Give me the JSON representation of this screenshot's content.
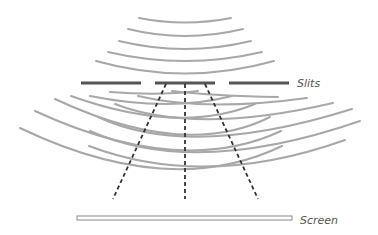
{
  "diagram": {
    "labels": {
      "slits": "Slits",
      "screen": "Screen"
    },
    "colors": {
      "wave": "#a8a8a8",
      "barrier": "#555555",
      "path": "#333333",
      "screen_stroke": "#8a8a8a",
      "label": "#555555"
    },
    "incoming_waves": [
      {
        "x1": 139,
        "y1": 18,
        "cx": 185,
        "cy": 27,
        "x2": 231,
        "y2": 18
      },
      {
        "x1": 128,
        "y1": 29,
        "cx": 185,
        "cy": 43,
        "x2": 243,
        "y2": 29
      },
      {
        "x1": 119,
        "y1": 41,
        "cx": 185,
        "cy": 57,
        "x2": 251,
        "y2": 41
      },
      {
        "x1": 108,
        "y1": 52,
        "cx": 185,
        "cy": 70,
        "x2": 262,
        "y2": 52
      },
      {
        "x1": 96,
        "y1": 61,
        "cx": 185,
        "cy": 86,
        "x2": 274,
        "y2": 61
      }
    ],
    "slit_bars": [
      {
        "x1": 81,
        "x2": 141,
        "y": 83
      },
      {
        "x1": 155,
        "x2": 215,
        "y": 83
      },
      {
        "x1": 229,
        "x2": 289,
        "y": 83
      }
    ],
    "left_source_waves": [
      {
        "x1": 110,
        "y1": 92,
        "cx": 160,
        "cy": 96,
        "x2": 198,
        "y2": 91
      },
      {
        "x1": 90,
        "y1": 96,
        "cx": 170,
        "cy": 112,
        "x2": 232,
        "y2": 96
      },
      {
        "x1": 71,
        "y1": 96,
        "cx": 180,
        "cy": 135,
        "x2": 255,
        "y2": 104
      },
      {
        "x1": 55,
        "y1": 99,
        "cx": 185,
        "cy": 160,
        "x2": 270,
        "y2": 117
      },
      {
        "x1": 35,
        "y1": 111,
        "cx": 180,
        "cy": 178,
        "x2": 281,
        "y2": 131
      },
      {
        "x1": 20,
        "y1": 128,
        "cx": 170,
        "cy": 200,
        "x2": 282,
        "y2": 146
      }
    ],
    "right_source_waves": [
      {
        "x1": 172,
        "y1": 91,
        "cx": 215,
        "cy": 96,
        "x2": 278,
        "y2": 97
      },
      {
        "x1": 138,
        "y1": 96,
        "cx": 205,
        "cy": 112,
        "x2": 307,
        "y2": 98
      },
      {
        "x1": 115,
        "y1": 104,
        "cx": 195,
        "cy": 135,
        "x2": 333,
        "y2": 103
      },
      {
        "x1": 98,
        "y1": 117,
        "cx": 190,
        "cy": 160,
        "x2": 352,
        "y2": 109
      },
      {
        "x1": 90,
        "y1": 131,
        "cx": 195,
        "cy": 178,
        "x2": 360,
        "y2": 121
      },
      {
        "x1": 89,
        "y1": 146,
        "cx": 205,
        "cy": 190,
        "x2": 345,
        "y2": 140
      }
    ],
    "paths": [
      {
        "x1": 166,
        "y1": 84,
        "x2": 113,
        "y2": 199
      },
      {
        "x1": 185,
        "y1": 84,
        "x2": 185,
        "y2": 199
      },
      {
        "x1": 205,
        "y1": 84,
        "x2": 258,
        "y2": 199
      }
    ],
    "screen": {
      "x": 77,
      "y": 216,
      "width": 215,
      "height": 4
    },
    "slits_label_pos": {
      "x": 297,
      "y": 87
    },
    "screen_label_pos": {
      "x": 300,
      "y": 224
    }
  }
}
